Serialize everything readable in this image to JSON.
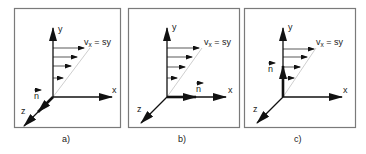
{
  "figure": {
    "colors": {
      "frame": "#7a7a7a",
      "axis": "#111111",
      "profile_line": "#c8c8c8",
      "text": "#222222"
    },
    "panels": [
      {
        "id": "a",
        "caption": "a)",
        "axes": {
          "x": "x",
          "y": "y",
          "z": "z"
        },
        "velocity_label_main": "v",
        "velocity_label_sub": "x",
        "velocity_label_rest": " = sy",
        "normal_label": "n",
        "normal_direction": "z"
      },
      {
        "id": "b",
        "caption": "b)",
        "axes": {
          "x": "x",
          "y": "y",
          "z": "z"
        },
        "velocity_label_main": "v",
        "velocity_label_sub": "x",
        "velocity_label_rest": " = sy",
        "normal_label": "n",
        "normal_direction": "x"
      },
      {
        "id": "c",
        "caption": "c)",
        "axes": {
          "x": "x",
          "y": "y",
          "z": "z"
        },
        "velocity_label_main": "v",
        "velocity_label_sub": "x",
        "velocity_label_rest": " = sy",
        "normal_label": "n",
        "normal_direction": "y"
      }
    ]
  }
}
